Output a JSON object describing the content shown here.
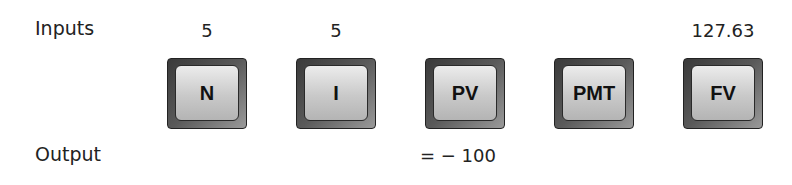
{
  "labels": {
    "inputs": "Inputs",
    "output": "Output"
  },
  "keys": [
    {
      "label": "N",
      "input": "5",
      "output": ""
    },
    {
      "label": "I",
      "input": "5",
      "output": ""
    },
    {
      "label": "PV",
      "input": "",
      "output": "= − 100"
    },
    {
      "label": "PMT",
      "input": "",
      "output": ""
    },
    {
      "label": "FV",
      "input": "127.63",
      "output": ""
    }
  ]
}
